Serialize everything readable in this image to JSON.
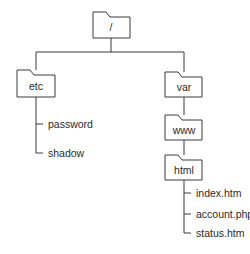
{
  "diagram": {
    "type": "directory-tree",
    "root": {
      "label": "/",
      "children": [
        {
          "label": "etc",
          "kind": "folder",
          "files": [
            "password",
            "shadow"
          ]
        },
        {
          "label": "var",
          "kind": "folder",
          "children": [
            {
              "label": "www",
              "kind": "folder",
              "children": [
                {
                  "label": "html",
                  "kind": "folder",
                  "files": [
                    "index.htm",
                    "account.php",
                    "status.htm"
                  ]
                }
              ]
            }
          ]
        }
      ]
    }
  },
  "labels": {
    "root": "/",
    "etc": "etc",
    "var": "var",
    "www": "www",
    "html": "html",
    "etc_files": [
      "password",
      "shadow"
    ],
    "html_files": [
      "index.htm",
      "account.php",
      "status.htm"
    ]
  },
  "colors": {
    "line": "#3a3a3a",
    "text": "#2a2a2a",
    "background": "#ffffff"
  }
}
